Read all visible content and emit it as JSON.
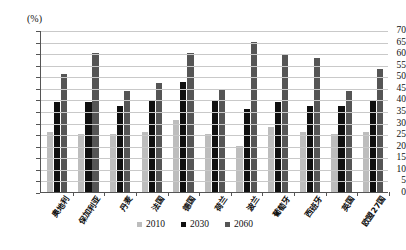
{
  "chart_data": {
    "type": "bar",
    "title": "",
    "subtitle": "",
    "xlabel": "",
    "ylabel": "(%)",
    "unit_label": "(%)",
    "ylim": [
      0,
      70
    ],
    "ytick_step": 5,
    "yticks": [
      "70",
      "65",
      "60",
      "55",
      "50",
      "45",
      "40",
      "35",
      "30",
      "25",
      "20",
      "15",
      "10",
      "5",
      "0"
    ],
    "grid": true,
    "legend_position": "bottom",
    "categories": [
      "奥地利",
      "保加利亚",
      "丹麦",
      "法国",
      "德国",
      "荷兰",
      "波兰",
      "葡萄牙",
      "西班牙",
      "英国",
      "欧盟27国"
    ],
    "series": [
      {
        "name": "2010",
        "color": "#bdbdbd",
        "values": [
          26,
          25,
          25,
          26,
          31,
          25,
          20,
          28,
          26,
          25,
          26
        ]
      },
      {
        "name": "2030",
        "color": "#101010",
        "values": [
          39,
          39,
          37,
          39.5,
          47.5,
          39.5,
          36,
          39,
          37,
          37,
          39.5
        ]
      },
      {
        "name": "2060",
        "color": "#555555",
        "values": [
          51,
          60,
          43.5,
          47,
          60,
          44,
          65,
          59,
          58,
          43.5,
          53
        ]
      }
    ]
  }
}
